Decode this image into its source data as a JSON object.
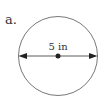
{
  "figure": {
    "label": "a.",
    "shape": "circle",
    "dimension_label": "5 in",
    "dimension_type": "diameter",
    "stroke_color": "#555555"
  }
}
